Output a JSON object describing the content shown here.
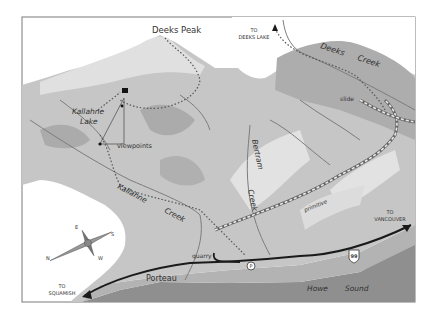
{
  "map": {
    "colors": {
      "background": "#ffffff",
      "frame": "#7a7a7a",
      "water": "#8f8f8f",
      "shore_shallow": "#b3b3b3",
      "lowland": "#bdbdbd",
      "mountain": "#cfcfcf",
      "ridge_light": "#e4e4e4",
      "shadow": "#a8a8a8",
      "stream": "#7d7d7d",
      "trail": "#6a6a6a",
      "highway": "#1a1a1a"
    },
    "labels": {
      "peak": "Deeks Peak",
      "to_deeks_lake_1": "TO",
      "to_deeks_lake_2": "DEEKS LAKE",
      "deeks_creek_1": "Deeks",
      "deeks_creek_2": "Creek",
      "slide": "slide",
      "lake_1": "Kallahne",
      "lake_2": "Lake",
      "viewpoints": "viewpoints",
      "kallahne_creek_1": "Kallahne",
      "kallahne_creek_2": "Creek",
      "bertram_creek_1": "Bertram",
      "bertram_creek_2": "Creek",
      "primitive": "primitive",
      "to_vancouver_1": "TO",
      "to_vancouver_2": "VANCOUVER",
      "highway_number": "99",
      "quarry": "quarry",
      "parking": "P",
      "porteau": "Porteau",
      "to_squamish_1": "TO",
      "to_squamish_2": "SQUAMISH",
      "howe_sound_1": "Howe",
      "howe_sound_2": "Sound"
    },
    "compass": {
      "north": "N",
      "south": "S",
      "east": "E",
      "west": "W"
    }
  }
}
